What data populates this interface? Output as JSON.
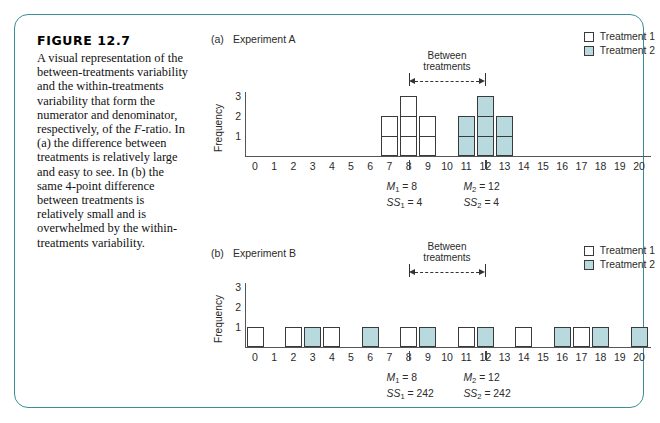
{
  "figure": {
    "label": "FIGURE 12.7",
    "caption": "A visual representation of the between-treatments variability and the within-treatments variability that form the numerator and denominator, respectively, of the F-ratio. In (a) the difference between treatments is relatively large and easy to see. In (b) the same 4-point difference between treatments is relatively small and is overwhelmed by the within-treatments variability.",
    "border_color": "#3c8e96"
  },
  "legend": {
    "items": [
      {
        "label": "Treatment 1",
        "color": "#ffffff",
        "swatch": "white-square"
      },
      {
        "label": "Treatment 2",
        "color": "#b8dade",
        "swatch": "teal-square"
      }
    ]
  },
  "annotation": {
    "between_line1": "Between",
    "between_line2": "treatments"
  },
  "panels": [
    {
      "id": "a",
      "panel_letter": "(a)",
      "title": "Experiment A",
      "ylabel": "Frequency",
      "yticks": [
        1,
        2,
        3
      ],
      "ylim": [
        0,
        3
      ],
      "xticks": [
        0,
        1,
        2,
        3,
        4,
        5,
        6,
        7,
        8,
        9,
        10,
        11,
        12,
        13,
        14,
        15,
        16,
        17,
        18,
        19,
        20
      ],
      "bracket_from": 8,
      "bracket_to": 12,
      "stats": [
        {
          "mean_label": "M",
          "mean_sub": "1",
          "mean_value": "8",
          "ss_label": "SS",
          "ss_sub": "1",
          "ss_value": "4",
          "at_x": 8
        },
        {
          "mean_label": "M",
          "mean_sub": "2",
          "mean_value": "12",
          "ss_label": "SS",
          "ss_sub": "2",
          "ss_value": "4",
          "at_x": 12
        }
      ],
      "chart_data": {
        "type": "bar",
        "title": "Experiment A",
        "xlabel": "",
        "ylabel": "Frequency",
        "ylim": [
          0,
          3
        ],
        "xlim": [
          0,
          20
        ],
        "grid": false,
        "legend_position": "top-right",
        "categories": [
          0,
          1,
          2,
          3,
          4,
          5,
          6,
          7,
          8,
          9,
          10,
          11,
          12,
          13,
          14,
          15,
          16,
          17,
          18,
          19,
          20
        ],
        "series": [
          {
            "name": "Treatment 1",
            "color": "#ffffff",
            "values": [
              0,
              0,
              0,
              0,
              0,
              0,
              0,
              2,
              3,
              2,
              0,
              0,
              0,
              0,
              0,
              0,
              0,
              0,
              0,
              0,
              0
            ]
          },
          {
            "name": "Treatment 2",
            "color": "#b8dade",
            "values": [
              0,
              0,
              0,
              0,
              0,
              0,
              0,
              0,
              0,
              0,
              0,
              2,
              3,
              2,
              0,
              0,
              0,
              0,
              0,
              0,
              0
            ]
          }
        ]
      }
    },
    {
      "id": "b",
      "panel_letter": "(b)",
      "title": "Experiment B",
      "ylabel": "Frequency",
      "yticks": [
        1,
        2,
        3
      ],
      "ylim": [
        0,
        3
      ],
      "xticks": [
        0,
        1,
        2,
        3,
        4,
        5,
        6,
        7,
        8,
        9,
        10,
        11,
        12,
        13,
        14,
        15,
        16,
        17,
        18,
        19,
        20
      ],
      "bracket_from": 8,
      "bracket_to": 12,
      "stats": [
        {
          "mean_label": "M",
          "mean_sub": "1",
          "mean_value": "8",
          "ss_label": "SS",
          "ss_sub": "1",
          "ss_value": "242",
          "at_x": 8
        },
        {
          "mean_label": "M",
          "mean_sub": "2",
          "mean_value": "12",
          "ss_label": "SS",
          "ss_sub": "2",
          "ss_value": "242",
          "at_x": 12
        }
      ],
      "chart_data": {
        "type": "bar",
        "title": "Experiment B",
        "xlabel": "",
        "ylabel": "Frequency",
        "ylim": [
          0,
          3
        ],
        "xlim": [
          0,
          20
        ],
        "grid": false,
        "legend_position": "top-right",
        "categories": [
          0,
          1,
          2,
          3,
          4,
          5,
          6,
          7,
          8,
          9,
          10,
          11,
          12,
          13,
          14,
          15,
          16,
          17,
          18,
          19,
          20
        ],
        "series": [
          {
            "name": "Treatment 1",
            "color": "#ffffff",
            "values": [
              1,
              0,
              1,
              0,
              1,
              0,
              0,
              0,
              1,
              0,
              0,
              1,
              0,
              0,
              1,
              0,
              0,
              1,
              0,
              0,
              0
            ]
          },
          {
            "name": "Treatment 2",
            "color": "#b8dade",
            "values": [
              0,
              0,
              0,
              1,
              0,
              0,
              1,
              0,
              0,
              1,
              0,
              0,
              1,
              0,
              0,
              0,
              1,
              0,
              1,
              0,
              1
            ]
          }
        ]
      }
    }
  ]
}
